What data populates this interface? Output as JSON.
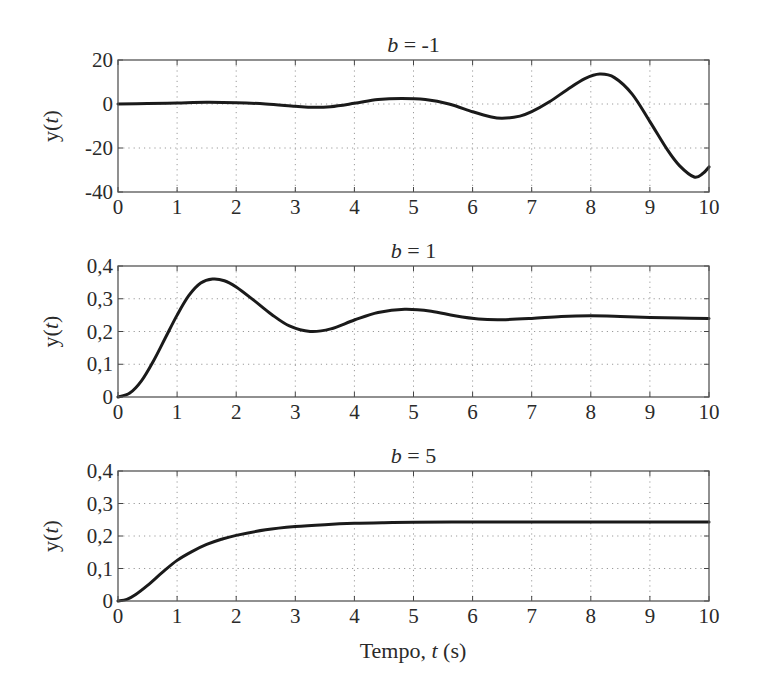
{
  "figure": {
    "xlabel": "Tempo, t (s)",
    "xlabel_parts": {
      "prefix": "Tempo, ",
      "var": "t",
      "suffix": " (s)"
    },
    "ylabel_parts": {
      "prefix": "y(",
      "var": "t",
      "suffix": ")"
    }
  },
  "chart_data": [
    {
      "type": "line",
      "title": "b = -1",
      "title_parts": {
        "var": "b",
        "rest": " = -1"
      },
      "xlabel": "",
      "ylabel": "y(t)",
      "xlim": [
        0,
        10
      ],
      "ylim": [
        -40,
        20
      ],
      "xticks": [
        0,
        1,
        2,
        3,
        4,
        5,
        6,
        7,
        8,
        9,
        10
      ],
      "xtick_labels": [
        "0",
        "1",
        "2",
        "3",
        "4",
        "5",
        "6",
        "7",
        "8",
        "9",
        "10"
      ],
      "yticks": [
        -40,
        -20,
        0,
        20
      ],
      "ytick_labels": [
        "-40",
        "-20",
        "0",
        "20"
      ],
      "grid": true,
      "series": [
        {
          "name": "b = -1",
          "color": "#1a1a1a",
          "x": [
            0,
            0.5,
            1,
            1.5,
            2,
            2.5,
            3,
            3.3,
            3.6,
            4,
            4.4,
            4.8,
            5.2,
            5.6,
            6,
            6.3,
            6.5,
            6.8,
            7,
            7.3,
            7.6,
            7.9,
            8.15,
            8.4,
            8.7,
            9,
            9.3,
            9.5,
            9.75,
            9.9,
            10
          ],
          "y": [
            0,
            0.2,
            0.5,
            0.8,
            0.6,
            0,
            -1.0,
            -1.5,
            -1.2,
            0.3,
            2.0,
            2.5,
            2.0,
            0,
            -3.5,
            -5.8,
            -6.5,
            -5.5,
            -3.5,
            1.0,
            6.5,
            11.5,
            13.6,
            12.0,
            4.5,
            -8.0,
            -21.0,
            -28.0,
            -33.2,
            -31.5,
            -28.6
          ]
        }
      ]
    },
    {
      "type": "line",
      "title": "b = 1",
      "title_parts": {
        "var": "b",
        "rest": " = 1"
      },
      "xlabel": "",
      "ylabel": "y(t)",
      "xlim": [
        0,
        10
      ],
      "ylim": [
        0,
        0.4
      ],
      "xticks": [
        0,
        1,
        2,
        3,
        4,
        5,
        6,
        7,
        8,
        9,
        10
      ],
      "xtick_labels": [
        "0",
        "1",
        "2",
        "3",
        "4",
        "5",
        "6",
        "7",
        "8",
        "9",
        "10"
      ],
      "yticks": [
        0,
        0.1,
        0.2,
        0.3,
        0.4
      ],
      "ytick_labels": [
        "0",
        "0,1",
        "0,2",
        "0,3",
        "0,4"
      ],
      "grid": true,
      "series": [
        {
          "name": "b = 1",
          "color": "#1a1a1a",
          "x": [
            0,
            0.2,
            0.4,
            0.6,
            0.8,
            1,
            1.2,
            1.4,
            1.6,
            1.8,
            2,
            2.3,
            2.6,
            2.9,
            3.25,
            3.6,
            4,
            4.4,
            4.85,
            5.3,
            5.7,
            6.1,
            6.5,
            7,
            7.5,
            8,
            8.5,
            9,
            9.5,
            10
          ],
          "y": [
            0,
            0.012,
            0.05,
            0.11,
            0.18,
            0.25,
            0.31,
            0.348,
            0.36,
            0.355,
            0.336,
            0.295,
            0.252,
            0.217,
            0.2,
            0.208,
            0.235,
            0.258,
            0.268,
            0.262,
            0.248,
            0.238,
            0.236,
            0.24,
            0.246,
            0.248,
            0.246,
            0.243,
            0.241,
            0.24
          ]
        }
      ]
    },
    {
      "type": "line",
      "title": "b = 5",
      "title_parts": {
        "var": "b",
        "rest": " = 5"
      },
      "xlabel": "Tempo, t (s)",
      "ylabel": "y(t)",
      "xlim": [
        0,
        10
      ],
      "ylim": [
        0,
        0.4
      ],
      "xticks": [
        0,
        1,
        2,
        3,
        4,
        5,
        6,
        7,
        8,
        9,
        10
      ],
      "xtick_labels": [
        "0",
        "1",
        "2",
        "3",
        "4",
        "5",
        "6",
        "7",
        "8",
        "9",
        "10"
      ],
      "yticks": [
        0,
        0.1,
        0.2,
        0.3,
        0.4
      ],
      "ytick_labels": [
        "0",
        "0,1",
        "0,2",
        "0,3",
        "0,4"
      ],
      "grid": true,
      "series": [
        {
          "name": "b = 5",
          "color": "#1a1a1a",
          "x": [
            0,
            0.15,
            0.3,
            0.5,
            0.75,
            1,
            1.25,
            1.5,
            1.75,
            2,
            2.5,
            3,
            3.5,
            4,
            4.5,
            5,
            6,
            7,
            8,
            9,
            10
          ],
          "y": [
            0,
            0.005,
            0.02,
            0.048,
            0.088,
            0.125,
            0.152,
            0.174,
            0.19,
            0.202,
            0.219,
            0.229,
            0.235,
            0.239,
            0.241,
            0.242,
            0.243,
            0.243,
            0.243,
            0.243,
            0.243
          ]
        }
      ]
    }
  ]
}
